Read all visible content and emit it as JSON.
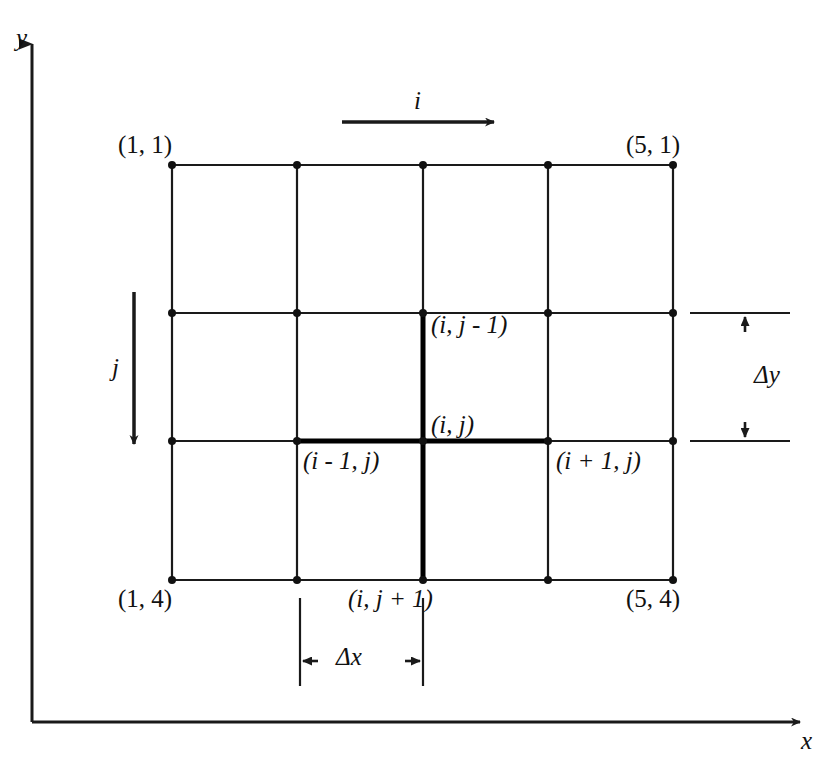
{
  "figure": {
    "kind": "finite-difference-grid-diagram",
    "background_color": "#ffffff",
    "line_color": "#1a1a1a",
    "bold_line_color": "#000000"
  },
  "axes": {
    "y_label": "y",
    "x_label": "x",
    "y_axis": {
      "from": [
        32,
        722
      ],
      "to": [
        32,
        35
      ]
    },
    "x_axis": {
      "from": [
        32,
        722
      ],
      "to": [
        812,
        722
      ]
    }
  },
  "index_arrows": {
    "i": {
      "label": "i",
      "direction": "right",
      "from": [
        342,
        122
      ],
      "to": [
        502,
        122
      ]
    },
    "j": {
      "label": "j",
      "direction": "down",
      "from": [
        134,
        292
      ],
      "to": [
        134,
        452
      ]
    }
  },
  "grid": {
    "columns": 5,
    "rows": 4,
    "x_positions": [
      172,
      297,
      423,
      548,
      673
    ],
    "y_positions": [
      165,
      313,
      441,
      580
    ],
    "node_radius": 4
  },
  "corner_labels": [
    {
      "name": "top-left",
      "text": "(1, 1)",
      "x": 118,
      "y": 132
    },
    {
      "name": "top-right",
      "text": "(5, 1)",
      "x": 626,
      "y": 132
    },
    {
      "name": "bottom-left",
      "text": "(1, 4)",
      "x": 118,
      "y": 586
    },
    {
      "name": "bottom-right",
      "text": "(5, 4)",
      "x": 626,
      "y": 586
    }
  ],
  "stencil_labels": [
    {
      "name": "north",
      "text": "(i, j - 1)",
      "x": 431,
      "y": 312
    },
    {
      "name": "center",
      "text": "(i, j)",
      "x": 431,
      "y": 412
    },
    {
      "name": "west",
      "text": "(i - 1, j)",
      "x": 303,
      "y": 448
    },
    {
      "name": "east",
      "text": "(i + 1, j)",
      "x": 556,
      "y": 448
    },
    {
      "name": "south",
      "text": "(i, j + 1)",
      "x": 348,
      "y": 586
    }
  ],
  "stencil": {
    "center_node": [
      423,
      441
    ],
    "horizontal_from": [
      297,
      441
    ],
    "horizontal_to": [
      548,
      441
    ],
    "vertical_from": [
      423,
      313
    ],
    "vertical_to": [
      423,
      580
    ],
    "stroke_width": 5
  },
  "dimensions": {
    "dx": {
      "label": "Δx",
      "label_x": 338,
      "label_y": 648,
      "line_y": 661,
      "from_x": 300,
      "to_x": 423,
      "ext_top_y": 598,
      "ext_bottom_y": 686
    },
    "dy": {
      "label": "Δy",
      "label_x": 756,
      "label_y": 365,
      "line_x": 745,
      "from_y": 313,
      "to_y": 441,
      "ext_left_x": 690,
      "ext_right_x": 790
    }
  },
  "chart_data": {
    "type": "diagram",
    "title": "",
    "grid_nodes_i": [
      1,
      2,
      3,
      4,
      5
    ],
    "grid_nodes_j": [
      1,
      2,
      3,
      4
    ],
    "annotations": [
      "(1, 1)",
      "(5, 1)",
      "(1, 4)",
      "(5, 4)",
      "(i, j - 1)",
      "(i, j)",
      "(i - 1, j)",
      "(i + 1, j)",
      "(i, j + 1)",
      "Δx",
      "Δy",
      "i",
      "j",
      "x",
      "y"
    ]
  }
}
